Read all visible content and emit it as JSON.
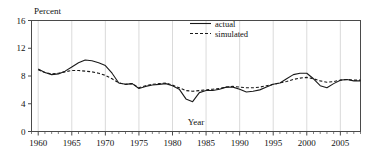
{
  "chart_data": {
    "type": "line",
    "title": "",
    "xlabel": "Year",
    "ylabel": "Percent",
    "xlim": [
      1959,
      2008
    ],
    "ylim": [
      0,
      16
    ],
    "yticks": [
      0,
      4,
      8,
      12,
      16
    ],
    "xticks": [
      1960,
      1965,
      1970,
      1975,
      1980,
      1985,
      1990,
      1995,
      2000,
      2005
    ],
    "xtick_labels": [
      "1960",
      "1965",
      "1970",
      "1975",
      "1980",
      "1985",
      "1990",
      "1995",
      "2000",
      "2005"
    ],
    "ytick_labels": [
      "0",
      "4",
      "8",
      "12",
      "16"
    ],
    "x_minor_tick_step": 1,
    "grid": "vertical-major-only",
    "legend_position": "top-center-right",
    "x": [
      1960,
      1961,
      1962,
      1963,
      1964,
      1965,
      1966,
      1967,
      1968,
      1969,
      1970,
      1971,
      1972,
      1973,
      1974,
      1975,
      1976,
      1977,
      1978,
      1979,
      1980,
      1981,
      1982,
      1983,
      1984,
      1985,
      1986,
      1987,
      1988,
      1989,
      1990,
      1991,
      1992,
      1993,
      1994,
      1995,
      1996,
      1997,
      1998,
      1999,
      2000,
      2001,
      2002,
      2003,
      2004,
      2005,
      2006,
      2007,
      2008
    ],
    "series": [
      {
        "name": "actual",
        "style": "solid",
        "color": "#1a1a1a",
        "values": [
          9.0,
          8.5,
          8.2,
          8.3,
          8.7,
          9.3,
          9.9,
          10.3,
          10.2,
          9.9,
          9.5,
          8.4,
          7.0,
          6.8,
          6.9,
          6.2,
          6.5,
          6.7,
          6.8,
          6.9,
          6.6,
          6.1,
          4.7,
          4.3,
          5.6,
          5.9,
          5.9,
          6.1,
          6.4,
          6.4,
          6.1,
          5.7,
          5.8,
          6.0,
          6.4,
          6.8,
          7.0,
          7.6,
          8.2,
          8.4,
          8.4,
          7.6,
          6.6,
          6.3,
          6.9,
          7.4,
          7.5,
          7.3,
          7.3
        ]
      },
      {
        "name": "simulated",
        "style": "dashed",
        "color": "#1a1a1a",
        "values": [
          8.9,
          8.5,
          8.3,
          8.4,
          8.6,
          8.8,
          8.8,
          8.7,
          8.6,
          8.4,
          8.1,
          7.6,
          7.0,
          6.8,
          6.9,
          6.3,
          6.6,
          6.8,
          6.9,
          7.0,
          6.7,
          6.3,
          5.9,
          5.8,
          5.9,
          6.0,
          6.1,
          6.2,
          6.4,
          6.5,
          6.4,
          6.3,
          6.3,
          6.4,
          6.6,
          6.8,
          7.0,
          7.2,
          7.5,
          7.7,
          7.8,
          7.6,
          7.3,
          7.1,
          7.2,
          7.4,
          7.5,
          7.4,
          7.4
        ]
      }
    ]
  },
  "legend": {
    "items": [
      {
        "label": "actual",
        "style": "solid"
      },
      {
        "label": "simulated",
        "style": "dashed"
      }
    ]
  },
  "colors": {
    "line": "#1a1a1a",
    "frame": "#4a4a4a",
    "grid": "#d0d0d0",
    "background": "#ffffff"
  }
}
